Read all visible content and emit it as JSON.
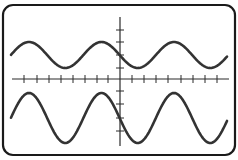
{
  "diagram": {
    "type": "oscilloscope-display",
    "colors": {
      "background": "#ffffff",
      "frame": "#1a1a1a",
      "axis": "#2a2a2a",
      "wave": "#333333"
    },
    "frame": {
      "x": 3,
      "y": 5,
      "width": 232,
      "height": 150,
      "corner_radius": 10
    },
    "horizontal_axis": {
      "y": 79,
      "x_start": 12,
      "x_end": 229,
      "tick_xs": [
        24,
        37,
        49,
        61,
        73,
        85,
        97,
        108,
        132,
        144,
        156,
        168,
        181,
        193,
        205,
        217
      ],
      "tick_half_length": 4
    },
    "vertical_axis": {
      "x": 120,
      "y_start": 17,
      "y_end": 146,
      "tick_ys": [
        30,
        42,
        55,
        68,
        91,
        104,
        118,
        131
      ],
      "tick_half_length": 4
    },
    "waves": [
      {
        "name": "top-sine-wave",
        "x_start": 11,
        "x_end": 227,
        "center_y": 55,
        "amplitude": 13,
        "period": 72.5,
        "phase_peak_x": 29
      },
      {
        "name": "bottom-sine-wave",
        "x_start": 11,
        "x_end": 227,
        "center_y": 118,
        "amplitude": 25,
        "period": 72.5,
        "phase_peak_x": 29
      }
    ]
  }
}
